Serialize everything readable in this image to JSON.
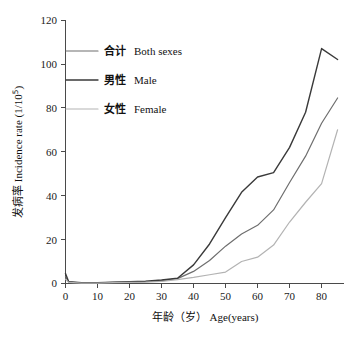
{
  "chart_data": {
    "type": "line",
    "title": "",
    "xlabel_cjk": "年龄（岁）",
    "xlabel_en": "Age(years)",
    "ylabel_cjk": "发病率",
    "ylabel_en": "Incidence  rate (1/10",
    "ylabel_exponent": "5",
    "ylabel_close": ")",
    "xlim": [
      0,
      87
    ],
    "ylim": [
      0,
      120
    ],
    "xticks": [
      0,
      10,
      20,
      30,
      40,
      50,
      60,
      70,
      80
    ],
    "yticks": [
      0,
      20,
      40,
      60,
      80,
      100,
      120
    ],
    "grid": false,
    "legend_position": "top-left",
    "x": [
      0,
      1,
      5,
      10,
      15,
      20,
      25,
      30,
      35,
      40,
      45,
      50,
      55,
      60,
      65,
      70,
      75,
      80,
      85
    ],
    "series": [
      {
        "name": "合计  Both sexes",
        "name_cjk": "合计",
        "name_en": "Both sexes",
        "color": "#6e6e6e",
        "values": [
          3.2,
          0.6,
          0.3,
          0.3,
          0.5,
          0.6,
          0.8,
          1.2,
          2.2,
          5.5,
          10.5,
          17.0,
          22.5,
          26.5,
          33.5,
          46.0,
          58.0,
          73.0,
          84.5
        ]
      },
      {
        "name": "男性  Male",
        "name_cjk": "男性",
        "name_en": "Male",
        "color": "#3a3a3a",
        "values": [
          4.6,
          0.8,
          0.4,
          0.4,
          0.6,
          0.8,
          1.0,
          1.6,
          2.4,
          8.5,
          18.0,
          30.0,
          41.5,
          48.5,
          50.5,
          62.0,
          78.0,
          107.0,
          102.0
        ]
      },
      {
        "name": "女性  Female",
        "name_cjk": "女性",
        "name_en": "Female",
        "color": "#b3b3b3",
        "values": [
          2.0,
          0.5,
          0.2,
          0.2,
          0.4,
          0.5,
          0.6,
          0.9,
          1.8,
          2.8,
          4.0,
          5.2,
          10.0,
          12.0,
          17.5,
          28.0,
          37.0,
          45.5,
          70.0
        ]
      }
    ]
  },
  "axes": {
    "y_ticks_text": [
      "0",
      "20",
      "40",
      "60",
      "80",
      "100",
      "120"
    ],
    "x_ticks_text": [
      "0",
      "10",
      "20",
      "30",
      "40",
      "50",
      "60",
      "70",
      "80"
    ]
  },
  "legend": {
    "items": [
      {
        "cjk": "合计",
        "en": "Both sexes",
        "color": "#6e6e6e"
      },
      {
        "cjk": "男性",
        "en": "Male",
        "color": "#3a3a3a"
      },
      {
        "cjk": "女性",
        "en": "Female",
        "color": "#b3b3b3"
      }
    ]
  }
}
